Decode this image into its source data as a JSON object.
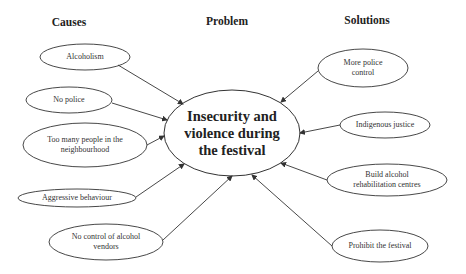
{
  "headers": {
    "causes": "Causes",
    "problem": "Problem",
    "solutions": "Solutions"
  },
  "problem": {
    "label": "Insecurity and\nviolence during\nthe festival"
  },
  "causes": [
    {
      "id": "alcoholism",
      "label": "Alcoholism"
    },
    {
      "id": "no-police",
      "label": "No police"
    },
    {
      "id": "too-many-people",
      "label": "Too many people in the\nneighbourhood"
    },
    {
      "id": "aggressive-behaviour",
      "label": "Aggressive behaviour"
    },
    {
      "id": "no-control-vendors",
      "label": "No control of alcohol\nvendors"
    }
  ],
  "solutions": [
    {
      "id": "more-police-control",
      "label": "More police\ncontrol"
    },
    {
      "id": "indigenous-justice",
      "label": "Indigenous justice"
    },
    {
      "id": "build-rehab-centres",
      "label": "Build alcohol\nrehabilitation centres"
    },
    {
      "id": "prohibit-festival",
      "label": "Prohibit the festival"
    }
  ],
  "colors": {
    "stroke": "#333333",
    "text": "#222222",
    "background": "#ffffff"
  }
}
